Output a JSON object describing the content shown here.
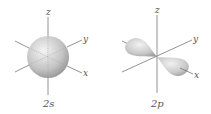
{
  "figure": {
    "panels": [
      {
        "id": "2s",
        "caption": "2s",
        "shape": "sphere",
        "axes": {
          "x": "x",
          "y": "y",
          "z": "z"
        }
      },
      {
        "id": "2p",
        "caption": "2p",
        "shape": "dumbbell",
        "orientation": "x",
        "axes": {
          "x": "x",
          "y": "y",
          "z": "z"
        }
      }
    ],
    "colors": {
      "axis": "#777777",
      "orbital_light": "#f2f2f2",
      "orbital_dark": "#8a8a8a",
      "label": "#555555"
    }
  }
}
